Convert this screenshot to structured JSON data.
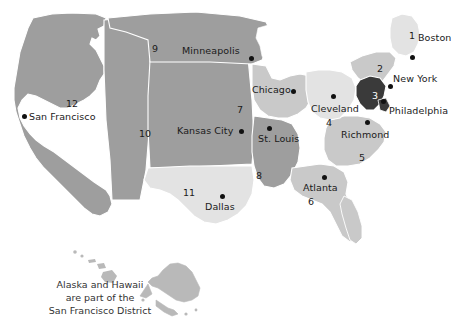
{
  "map": {
    "title": "Federal Reserve Districts Map",
    "colors": {
      "background": "#ffffff",
      "district_light": "#e3e3e3",
      "district_mid": "#c9c9c9",
      "district_dark": "#9e9e9e",
      "district_highlight": "#3a3a3a",
      "border": "#ffffff",
      "text": "#1a1a1a",
      "dot": "#111111",
      "inset_fill": "#b9b9b9"
    },
    "districts": [
      {
        "number": "1",
        "x": 409,
        "y": 30,
        "shade": "light"
      },
      {
        "number": "2",
        "x": 377,
        "y": 63,
        "shade": "mid"
      },
      {
        "number": "3",
        "x": 372,
        "y": 90,
        "shade": "highlight"
      },
      {
        "number": "4",
        "x": 326,
        "y": 117,
        "shade": "light"
      },
      {
        "number": "5",
        "x": 359,
        "y": 152,
        "shade": "mid"
      },
      {
        "number": "6",
        "x": 308,
        "y": 196,
        "shade": "mid"
      },
      {
        "number": "7",
        "x": 237,
        "y": 104,
        "shade": "mid"
      },
      {
        "number": "8",
        "x": 256,
        "y": 170,
        "shade": "dark"
      },
      {
        "number": "9",
        "x": 152,
        "y": 43,
        "shade": "dark"
      },
      {
        "number": "10",
        "x": 139,
        "y": 128,
        "shade": "dark"
      },
      {
        "number": "11",
        "x": 183,
        "y": 187,
        "shade": "light"
      },
      {
        "number": "12",
        "x": 66,
        "y": 98,
        "shade": "dark"
      }
    ],
    "cities": [
      {
        "name": "Boston",
        "dot_x": 410,
        "dot_y": 55,
        "label_x": 418,
        "label_y": 33,
        "align": "left"
      },
      {
        "name": "New York",
        "dot_x": 388,
        "dot_y": 84,
        "label_x": 393,
        "label_y": 74,
        "align": "left"
      },
      {
        "name": "Philadelphia",
        "dot_x": 381,
        "dot_y": 99,
        "label_x": 389,
        "label_y": 106,
        "align": "left"
      },
      {
        "name": "Richmond",
        "dot_x": 365,
        "dot_y": 120,
        "label_x": 341,
        "label_y": 130,
        "align": "left"
      },
      {
        "name": "Cleveland",
        "dot_x": 331,
        "dot_y": 94,
        "label_x": 311,
        "label_y": 104,
        "align": "left"
      },
      {
        "name": "Atlanta",
        "dot_x": 322,
        "dot_y": 175,
        "label_x": 303,
        "label_y": 183,
        "align": "left"
      },
      {
        "name": "Chicago",
        "dot_x": 291,
        "dot_y": 89,
        "label_x": 252,
        "label_y": 85,
        "align": "left"
      },
      {
        "name": "St. Louis",
        "dot_x": 267,
        "dot_y": 126,
        "label_x": 258,
        "label_y": 134,
        "align": "left"
      },
      {
        "name": "Minneapolis",
        "dot_x": 249,
        "dot_y": 56,
        "label_x": 182,
        "label_y": 46,
        "align": "left"
      },
      {
        "name": "Kansas City",
        "dot_x": 239,
        "dot_y": 129,
        "label_x": 177,
        "label_y": 126,
        "align": "left"
      },
      {
        "name": "Dallas",
        "dot_x": 220,
        "dot_y": 194,
        "label_x": 205,
        "label_y": 202,
        "align": "left"
      },
      {
        "name": "San Francisco",
        "dot_x": 22,
        "dot_y": 114,
        "label_x": 29,
        "label_y": 112,
        "align": "left"
      }
    ],
    "caption": {
      "line1": "Alaska and Hawaii",
      "line2": "are part of the",
      "line3": "San Francisco District"
    }
  }
}
